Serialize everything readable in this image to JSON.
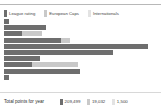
{
  "legend": {
    "items": [
      {
        "label": "League rating",
        "color": "#6e6e6e",
        "icon": "legend-swatch"
      },
      {
        "label": "European Caps",
        "color": "#c9c9c9",
        "icon": "legend-swatch"
      },
      {
        "label": "Internationals",
        "color": "#e3e3e3",
        "icon": "legend-swatch"
      }
    ]
  },
  "footer": {
    "title": "Total points for year",
    "totals": [
      {
        "value": "209,499",
        "color": "#6e6e6e"
      },
      {
        "value": "19,032",
        "color": "#c9c9c9"
      },
      {
        "value": "1,500",
        "color": "#e3e3e3"
      }
    ]
  },
  "chart_data": {
    "type": "bar",
    "orientation": "horizontal",
    "stacked": true,
    "title": "",
    "xlabel": "",
    "ylabel": "",
    "grid": false,
    "legend_position": "top-left",
    "categories": [
      "1",
      "2",
      "3",
      "4",
      "5",
      "6",
      "7",
      "8",
      "9",
      "10",
      "11"
    ],
    "series": [
      {
        "name": "League rating",
        "color": "#6e6e6e",
        "values": [
          5,
          42,
          18,
          57,
          144,
          109,
          36,
          28,
          76,
          5,
          0
        ]
      },
      {
        "name": "European Caps",
        "color": "#c9c9c9",
        "values": [
          0,
          0,
          20,
          9,
          0,
          0,
          0,
          46,
          0,
          0,
          0
        ]
      },
      {
        "name": "Internationals",
        "color": "#e3e3e3",
        "values": [
          0,
          0,
          0,
          0,
          0,
          0,
          0,
          0,
          0,
          0,
          0
        ]
      }
    ],
    "xlim": [
      0,
      153
    ],
    "axis_unit": "px"
  }
}
